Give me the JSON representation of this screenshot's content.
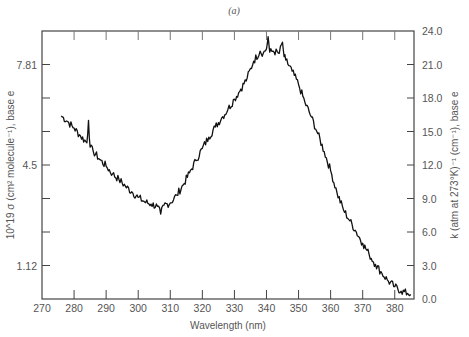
{
  "chart_data": {
    "type": "line",
    "panel_label": "(a)",
    "xlabel": "Wavelength (nm)",
    "ylabel_left": "10^19 σ (cm² molecule⁻¹), base e",
    "ylabel_right": "k (atm at 273°K)⁻¹ (cm⁻¹), base e",
    "xlim": [
      270,
      386
    ],
    "x_ticks": [
      270,
      280,
      290,
      300,
      310,
      320,
      330,
      340,
      350,
      360,
      370,
      380
    ],
    "x_tick_labels": [
      "270",
      "280",
      "290",
      "300",
      "310",
      "320",
      "330",
      "340",
      "350",
      "360",
      "370",
      "380"
    ],
    "ylim_right": [
      0,
      24
    ],
    "y_ticks_right": [
      0,
      3,
      6,
      9,
      12,
      15,
      18,
      21,
      24
    ],
    "y_tick_labels_right": [
      "0.0",
      "3.0",
      "6.0",
      "9.0",
      "12.0",
      "15.0",
      "18.0",
      "21.0",
      "24.0"
    ],
    "y_ticks_left_labeled": [
      {
        "label": "7.81",
        "right_equiv": 21.0
      },
      {
        "label": "4.5",
        "right_equiv": 12.0
      },
      {
        "label": "1.12",
        "right_equiv": 3.0
      }
    ],
    "grid": false,
    "legend": null,
    "series": [
      {
        "name": "absorption",
        "axis": "right",
        "x": [
          276,
          278,
          280,
          282,
          284,
          284.5,
          285,
          286,
          288,
          290,
          292,
          294,
          296,
          298,
          300,
          302,
          304,
          306,
          307,
          308,
          310,
          312,
          314,
          316,
          318,
          320,
          322,
          324,
          326,
          328,
          330,
          332,
          334,
          336,
          338,
          339,
          340,
          340.5,
          341,
          342,
          344,
          345,
          345.5,
          346,
          348,
          350,
          352,
          354,
          356,
          358,
          360,
          362,
          364,
          366,
          368,
          370,
          372,
          374,
          376,
          378,
          380,
          382,
          384,
          385
        ],
        "values": [
          16.4,
          15.9,
          15.3,
          14.6,
          14.0,
          16.0,
          13.6,
          13.2,
          12.5,
          11.9,
          11.2,
          10.7,
          10.1,
          9.6,
          9.1,
          8.7,
          8.5,
          8.3,
          7.6,
          8.4,
          8.6,
          9.3,
          10.2,
          11.3,
          12.4,
          13.5,
          14.5,
          15.4,
          16.2,
          17.0,
          17.9,
          18.8,
          19.8,
          21.3,
          22.2,
          22.0,
          22.4,
          23.5,
          22.1,
          22.2,
          22.0,
          23.0,
          21.7,
          21.4,
          20.4,
          19.2,
          17.6,
          16.3,
          14.8,
          13.2,
          11.5,
          9.5,
          8.0,
          7.0,
          6.0,
          5.0,
          4.0,
          3.1,
          2.3,
          1.6,
          1.1,
          0.7,
          0.5,
          0.4
        ]
      }
    ]
  },
  "layout": {
    "plot_left": 42,
    "plot_right": 414,
    "plot_top": 31,
    "plot_bottom": 299,
    "line_color": "#111111",
    "axis_color": "#444444"
  }
}
